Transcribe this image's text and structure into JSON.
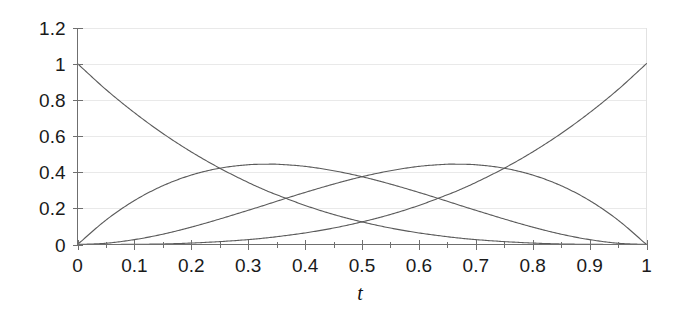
{
  "chart_data": {
    "type": "line",
    "title": "",
    "subtitle": "",
    "xlabel": "t",
    "ylabel": "",
    "xlim": [
      0,
      1
    ],
    "ylim": [
      0,
      1.2
    ],
    "grid": true,
    "legend": false,
    "legend_position": "none",
    "annotations": [],
    "x_ticks": [
      "0",
      "0.1",
      "0.2",
      "0.3",
      "0.4",
      "0.5",
      "0.6",
      "0.7",
      "0.8",
      "0.9",
      "1"
    ],
    "x_tick_values": [
      0,
      0.1,
      0.2,
      0.3,
      0.4,
      0.5,
      0.6,
      0.7,
      0.8,
      0.9,
      1
    ],
    "y_ticks": [
      "0",
      "0.2",
      "0.4",
      "0.6",
      "0.8",
      "1",
      "1.2"
    ],
    "y_tick_values": [
      0,
      0.2,
      0.4,
      0.6,
      0.8,
      1,
      1.2
    ],
    "x": [
      0,
      0.05,
      0.1,
      0.15,
      0.2,
      0.25,
      0.3,
      0.3333,
      0.35,
      0.4,
      0.45,
      0.5,
      0.55,
      0.6,
      0.65,
      0.6667,
      0.7,
      0.75,
      0.8,
      0.85,
      0.9,
      0.95,
      1
    ],
    "series": [
      {
        "name": "B0 = (1-t)^3",
        "color": "#5b5b5b",
        "values": [
          1.0,
          0.857,
          0.729,
          0.614,
          0.512,
          0.422,
          0.343,
          0.296,
          0.275,
          0.216,
          0.166,
          0.125,
          0.091,
          0.064,
          0.043,
          0.037,
          0.027,
          0.016,
          0.008,
          0.003,
          0.001,
          0.0,
          0.0
        ]
      },
      {
        "name": "B1 = 3t(1-t)^2",
        "color": "#5b5b5b",
        "values": [
          0.0,
          0.135,
          0.243,
          0.325,
          0.384,
          0.422,
          0.441,
          0.444,
          0.444,
          0.432,
          0.408,
          0.375,
          0.334,
          0.288,
          0.239,
          0.222,
          0.189,
          0.141,
          0.096,
          0.057,
          0.027,
          0.007,
          0.0
        ]
      },
      {
        "name": "B2 = 3t^2(1-t)",
        "color": "#5b5b5b",
        "values": [
          0.0,
          0.007,
          0.027,
          0.057,
          0.096,
          0.141,
          0.189,
          0.222,
          0.239,
          0.288,
          0.334,
          0.375,
          0.408,
          0.432,
          0.444,
          0.444,
          0.441,
          0.422,
          0.384,
          0.325,
          0.243,
          0.135,
          0.0
        ]
      },
      {
        "name": "B3 = t^3",
        "color": "#5b5b5b",
        "values": [
          0.0,
          0.0,
          0.001,
          0.003,
          0.008,
          0.016,
          0.027,
          0.037,
          0.043,
          0.064,
          0.091,
          0.125,
          0.166,
          0.216,
          0.275,
          0.296,
          0.343,
          0.422,
          0.512,
          0.614,
          0.729,
          0.857,
          1.0
        ]
      }
    ]
  },
  "axis": {
    "x_title": "t"
  },
  "colors": {
    "curve": "#5b5b5b",
    "grid": "#e9e9e9",
    "axis": "#6f6f6f",
    "text": "#1a1a1a",
    "background": "#ffffff"
  }
}
